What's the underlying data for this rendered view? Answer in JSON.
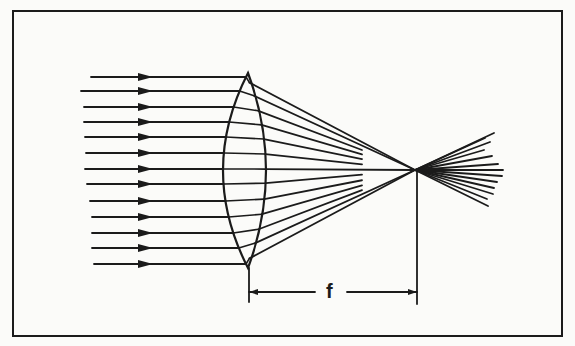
{
  "figure": {
    "colors": {
      "background": "#fbfbf9",
      "ink": "#1b1b1b"
    },
    "frame": {
      "x": 13,
      "y": 11,
      "w": 549,
      "h": 325
    },
    "lens": {
      "cx": 248,
      "top": 73,
      "bottom": 268,
      "left_bulge_x": 223,
      "right_bulge_x": 266
    },
    "focal_point": {
      "x": 415,
      "y": 170
    },
    "incoming_rays": [
      {
        "y": 77,
        "x_start": 91
      },
      {
        "y": 91,
        "x_start": 81
      },
      {
        "y": 107,
        "x_start": 84
      },
      {
        "y": 122,
        "x_start": 84
      },
      {
        "y": 137,
        "x_start": 85
      },
      {
        "y": 153,
        "x_start": 86
      },
      {
        "y": 169,
        "x_start": 85
      },
      {
        "y": 184,
        "x_start": 87
      },
      {
        "y": 201,
        "x_start": 90
      },
      {
        "y": 217,
        "x_start": 92
      },
      {
        "y": 233,
        "x_start": 92
      },
      {
        "y": 248,
        "x_start": 92
      },
      {
        "y": 264,
        "x_start": 94
      }
    ],
    "arrowhead": {
      "x_tip": 153,
      "length": 15,
      "half_height": 4
    },
    "converging_stop_x": 362,
    "diverging_ends": [
      {
        "x": 494,
        "y": 133
      },
      {
        "x": 485,
        "y": 138
      },
      {
        "x": 490,
        "y": 142
      },
      {
        "x": 484,
        "y": 150
      },
      {
        "x": 492,
        "y": 156
      },
      {
        "x": 498,
        "y": 164
      },
      {
        "x": 503,
        "y": 170
      },
      {
        "x": 502,
        "y": 176
      },
      {
        "x": 497,
        "y": 182
      },
      {
        "x": 494,
        "y": 188
      },
      {
        "x": 493,
        "y": 194
      },
      {
        "x": 487,
        "y": 199
      },
      {
        "x": 488,
        "y": 206
      }
    ],
    "dimension": {
      "label": "f",
      "y": 292,
      "left_x": 249,
      "right_x": 417,
      "gap_left": 315,
      "gap_right": 347,
      "left_tick": [
        268,
        302
      ],
      "right_tick": [
        172,
        304
      ]
    }
  }
}
